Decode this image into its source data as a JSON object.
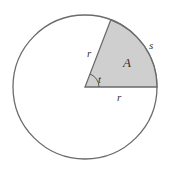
{
  "diagram": {
    "colors": {
      "stroke": "#6b6b6b",
      "sector_fill": "#cfcfcf",
      "background": "#ffffff",
      "text": "#333333"
    },
    "circle": {
      "cx": 85,
      "cy": 87,
      "r": 72
    },
    "sector": {
      "angle_deg": 69
    },
    "labels": {
      "radius_slanted": "r",
      "radius_horizontal": "r",
      "arc_length": "s",
      "area": "A",
      "angle": "t"
    }
  }
}
